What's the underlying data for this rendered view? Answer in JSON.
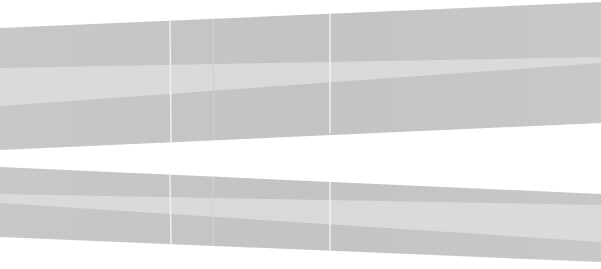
{
  "image": {
    "width": 601,
    "height": 269,
    "background": "#ffffff",
    "description": "Two long gray glass panels shown in perspective with light reflection bands and vertical seams"
  },
  "colors": {
    "panel": "#c8c8c8",
    "panel_dark": "#c3c3c3",
    "reflection": "#dbdbdb",
    "seam": "#f0f0f0",
    "seam_faint": "#d2d2d2"
  },
  "panels": [
    {
      "name": "top-panel",
      "polygon": [
        [
          0,
          28
        ],
        [
          601,
          2
        ],
        [
          601,
          123
        ],
        [
          0,
          150
        ]
      ],
      "reflection": [
        [
          0,
          68
        ],
        [
          601,
          57
        ],
        [
          601,
          63
        ],
        [
          0,
          106
        ]
      ],
      "seams": [
        {
          "x_top": 170,
          "x_bottom": 171,
          "y_top": 20,
          "y_bottom": 142,
          "style": "seam"
        },
        {
          "x_top": 213,
          "x_bottom": 214,
          "y_top": 19,
          "y_bottom": 140,
          "style": "seam_faint"
        },
        {
          "x_top": 330,
          "x_bottom": 330,
          "y_top": 14,
          "y_bottom": 133,
          "style": "seam"
        }
      ]
    },
    {
      "name": "bottom-panel",
      "polygon": [
        [
          0,
          167
        ],
        [
          601,
          194
        ],
        [
          601,
          262
        ],
        [
          0,
          237
        ]
      ],
      "reflection": [
        [
          0,
          194
        ],
        [
          601,
          205
        ],
        [
          601,
          242
        ],
        [
          0,
          203
        ]
      ],
      "seams": [
        {
          "x_top": 170,
          "x_bottom": 171,
          "y_top": 174,
          "y_bottom": 244,
          "style": "seam"
        },
        {
          "x_top": 213,
          "x_bottom": 213,
          "y_top": 176,
          "y_bottom": 246,
          "style": "seam_faint"
        },
        {
          "x_top": 330,
          "x_bottom": 330,
          "y_top": 181,
          "y_bottom": 251,
          "style": "seam"
        }
      ]
    }
  ]
}
